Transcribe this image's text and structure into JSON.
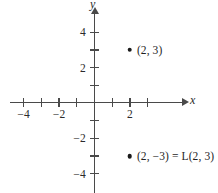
{
  "figure": {
    "type": "coordinate-plane",
    "width": 218,
    "height": 193,
    "background_color": "#ffffff",
    "axis_color": "#4a4a4a",
    "text_color": "#1f1f1f",
    "point_color": "#1a1a1a"
  },
  "axes": {
    "x": {
      "name": "x",
      "origin_px": 94.5,
      "unit_px": 17.7,
      "tick_values": [
        -4,
        -3,
        -2,
        -1,
        1,
        2,
        3
      ],
      "labeled_ticks": [
        {
          "value": -4,
          "text": "−4"
        },
        {
          "value": -2,
          "text": "−2"
        },
        {
          "value": 2,
          "text": "2"
        }
      ],
      "range": [
        -4.8,
        5.1
      ]
    },
    "y": {
      "name": "y",
      "origin_px": 103,
      "unit_px": 17.7,
      "tick_values": [
        4,
        3,
        2,
        1,
        -1,
        -2,
        -3,
        -4
      ],
      "labeled_ticks": [
        {
          "value": 4,
          "text": "4"
        },
        {
          "value": 2,
          "text": "2"
        },
        {
          "value": -2,
          "text": "−2"
        },
        {
          "value": -4,
          "text": "−4"
        }
      ],
      "range": [
        -5.1,
        5.1
      ]
    }
  },
  "points": [
    {
      "id": "point-upper",
      "x": 2,
      "y": 3,
      "label": "(2, 3)"
    },
    {
      "id": "point-lower",
      "x": 2,
      "y": -3,
      "label": "(2, −3) = L(2, 3)"
    }
  ],
  "chart_data": {
    "type": "scatter",
    "title": "",
    "xlabel": "x",
    "ylabel": "y",
    "xlim": [
      -4.8,
      5.1
    ],
    "ylim": [
      -5.1,
      5.1
    ],
    "grid": false,
    "legend": "none",
    "x": [
      2,
      2
    ],
    "y": [
      3,
      -3
    ],
    "point_labels": [
      "(2, 3)",
      "(2, −3) = L(2, 3)"
    ],
    "xticks": [
      -4,
      -3,
      -2,
      -1,
      1,
      2,
      3
    ],
    "xticklabels": [
      "−4",
      "",
      "−2",
      "",
      "",
      "2",
      ""
    ],
    "yticks": [
      -4,
      -3,
      -2,
      -1,
      1,
      2,
      3,
      4
    ],
    "yticklabels": [
      "−4",
      "",
      "−2",
      "",
      "",
      "2",
      "",
      "4"
    ]
  }
}
